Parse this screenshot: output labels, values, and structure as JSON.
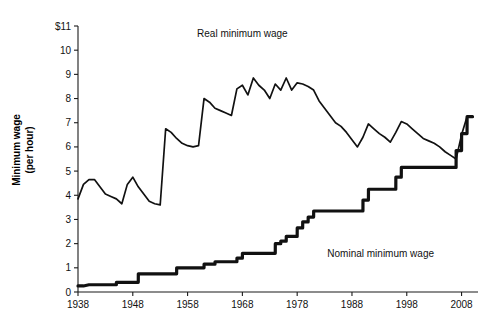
{
  "chart_data": {
    "type": "line",
    "title": "",
    "xlabel": "",
    "ylabel": "Minimum wage",
    "ylabel_line2": "(per hour)",
    "xlim": [
      1938,
      2011
    ],
    "ylim": [
      0,
      11
    ],
    "grid": false,
    "legend_position": "inline-annotations",
    "y_ticks": [
      0,
      1,
      2,
      3,
      4,
      5,
      6,
      7,
      8,
      9,
      10,
      11
    ],
    "y_tick_labels": [
      "0",
      "1",
      "2",
      "3",
      "4",
      "5",
      "6",
      "7",
      "8",
      "9",
      "10",
      "$11"
    ],
    "x_ticks": [
      1938,
      1948,
      1958,
      1968,
      1978,
      1988,
      1998,
      2008
    ],
    "x_tick_labels": [
      "1938",
      "1948",
      "1958",
      "1968",
      "1978",
      "1988",
      "1998",
      "2008"
    ],
    "annotations": [
      {
        "name": "real-series-label",
        "text": "Real minimum wage",
        "x": 1968,
        "y": 10.55
      },
      {
        "name": "nominal-series-label",
        "text": "Nominal minimum wage",
        "x": 1983.5,
        "y": 1.45
      }
    ],
    "series": [
      {
        "name": "Real minimum wage",
        "color": "#111111",
        "stroke_width": 1.7,
        "x": [
          1938,
          1939,
          1940,
          1941,
          1942,
          1943,
          1944,
          1945,
          1946,
          1947,
          1948,
          1949,
          1950,
          1951,
          1952,
          1953,
          1954,
          1955,
          1956,
          1957,
          1958,
          1959,
          1960,
          1961,
          1962,
          1963,
          1964,
          1965,
          1966,
          1967,
          1968,
          1969,
          1970,
          1971,
          1972,
          1973,
          1974,
          1975,
          1976,
          1977,
          1978,
          1979,
          1980,
          1981,
          1982,
          1983,
          1984,
          1985,
          1986,
          1987,
          1988,
          1989,
          1990,
          1991,
          1992,
          1993,
          1994,
          1995,
          1996,
          1997,
          1998,
          1999,
          2000,
          2001,
          2002,
          2003,
          2004,
          2005,
          2006,
          2007,
          2008,
          2009,
          2010
        ],
        "values": [
          3.85,
          4.45,
          4.65,
          4.65,
          4.35,
          4.05,
          3.95,
          3.85,
          3.65,
          4.45,
          4.75,
          4.35,
          4.05,
          3.75,
          3.65,
          3.6,
          6.75,
          6.6,
          6.35,
          6.15,
          6.05,
          6.0,
          6.05,
          8.0,
          7.85,
          7.6,
          7.5,
          7.4,
          7.3,
          8.4,
          8.55,
          8.15,
          8.85,
          8.55,
          8.35,
          8.0,
          8.6,
          8.35,
          8.85,
          8.35,
          8.65,
          8.6,
          8.5,
          8.35,
          7.9,
          7.6,
          7.3,
          7.0,
          6.85,
          6.6,
          6.3,
          6.0,
          6.4,
          6.95,
          6.75,
          6.55,
          6.4,
          6.2,
          6.6,
          7.05,
          6.95,
          6.75,
          6.55,
          6.35,
          6.25,
          6.15,
          6.0,
          5.8,
          5.65,
          5.5,
          6.5,
          7.25,
          7.25
        ]
      },
      {
        "name": "Nominal minimum wage",
        "color": "#111111",
        "stroke_width": 3.2,
        "x": [
          1938,
          1939,
          1940,
          1941,
          1942,
          1943,
          1944,
          1945,
          1945.01,
          1946,
          1947,
          1948,
          1949,
          1949.01,
          1950,
          1950.01,
          1951,
          1952,
          1953,
          1954,
          1955,
          1956,
          1956.01,
          1957,
          1958,
          1959,
          1960,
          1961,
          1961.01,
          1962,
          1963,
          1963.01,
          1964,
          1965,
          1966,
          1967,
          1967.01,
          1968,
          1968.01,
          1969,
          1970,
          1971,
          1972,
          1973,
          1974,
          1974.01,
          1975,
          1975.01,
          1976,
          1976.01,
          1977,
          1978,
          1978.01,
          1979,
          1979.01,
          1980,
          1980.01,
          1981,
          1981.01,
          1982,
          1983,
          1984,
          1985,
          1986,
          1987,
          1988,
          1989,
          1990,
          1990.01,
          1991,
          1991.01,
          1992,
          1993,
          1994,
          1995,
          1996,
          1996.01,
          1997,
          1997.01,
          1998,
          1999,
          2000,
          2001,
          2002,
          2003,
          2004,
          2005,
          2006,
          2007,
          2007.01,
          2008,
          2008.01,
          2009,
          2009.01,
          2010
        ],
        "values": [
          0.25,
          0.25,
          0.3,
          0.3,
          0.3,
          0.3,
          0.3,
          0.3,
          0.4,
          0.4,
          0.4,
          0.4,
          0.4,
          0.75,
          0.75,
          0.75,
          0.75,
          0.75,
          0.75,
          0.75,
          0.75,
          0.75,
          1.0,
          1.0,
          1.0,
          1.0,
          1.0,
          1.0,
          1.15,
          1.15,
          1.15,
          1.25,
          1.25,
          1.25,
          1.25,
          1.25,
          1.4,
          1.4,
          1.6,
          1.6,
          1.6,
          1.6,
          1.6,
          1.6,
          1.6,
          2.0,
          2.0,
          2.1,
          2.1,
          2.3,
          2.3,
          2.3,
          2.65,
          2.65,
          2.9,
          2.9,
          3.1,
          3.1,
          3.35,
          3.35,
          3.35,
          3.35,
          3.35,
          3.35,
          3.35,
          3.35,
          3.35,
          3.35,
          3.8,
          3.8,
          4.25,
          4.25,
          4.25,
          4.25,
          4.25,
          4.25,
          4.75,
          4.75,
          5.15,
          5.15,
          5.15,
          5.15,
          5.15,
          5.15,
          5.15,
          5.15,
          5.15,
          5.15,
          5.15,
          5.85,
          5.85,
          6.55,
          6.55,
          7.25,
          7.25
        ]
      }
    ]
  }
}
